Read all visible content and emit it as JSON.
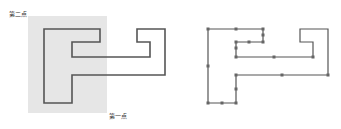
{
  "diagram": {
    "left": {
      "selection_rect": {
        "x": 28,
        "y": 16,
        "w": 79,
        "h": 97,
        "fill": "#e6e6e6"
      },
      "label_second_point": "第二点",
      "label_first_point": "第一点",
      "shape_points": [
        [
          44,
          29
        ],
        [
          100,
          29
        ],
        [
          100,
          42
        ],
        [
          72,
          42
        ],
        [
          72,
          57
        ],
        [
          150,
          57
        ],
        [
          150,
          42
        ],
        [
          137,
          42
        ],
        [
          137,
          29
        ],
        [
          165,
          29
        ],
        [
          165,
          75
        ],
        [
          72,
          75
        ],
        [
          72,
          103
        ],
        [
          44,
          103
        ]
      ]
    },
    "right": {
      "shape_points": [
        [
          208,
          29
        ],
        [
          263,
          29
        ],
        [
          263,
          42
        ],
        [
          236,
          42
        ],
        [
          236,
          57
        ],
        [
          313,
          57
        ],
        [
          313,
          42
        ],
        [
          300,
          42
        ],
        [
          300,
          29
        ],
        [
          328,
          29
        ],
        [
          328,
          75
        ],
        [
          236,
          75
        ],
        [
          236,
          103
        ],
        [
          208,
          103
        ]
      ],
      "grip_points": [
        [
          208,
          29
        ],
        [
          236,
          29
        ],
        [
          263,
          29
        ],
        [
          263,
          35
        ],
        [
          263,
          42
        ],
        [
          249,
          42
        ],
        [
          236,
          42
        ],
        [
          236,
          48
        ],
        [
          236,
          57
        ],
        [
          274,
          57
        ],
        [
          313,
          57
        ],
        [
          328,
          75
        ],
        [
          282,
          75
        ],
        [
          236,
          75
        ],
        [
          236,
          89
        ],
        [
          236,
          103
        ],
        [
          222,
          103
        ],
        [
          208,
          103
        ],
        [
          208,
          66
        ]
      ]
    },
    "line_color": "#555555",
    "grip_color": "#666666"
  }
}
